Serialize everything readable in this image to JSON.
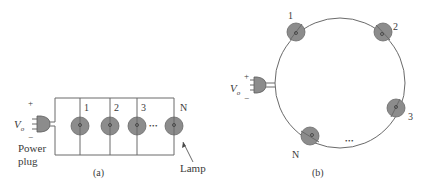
{
  "figure": {
    "panel_a": {
      "caption": "(a)",
      "source_label": {
        "symbol": "V",
        "subscript": "o",
        "plus": "+",
        "minus": "−"
      },
      "plug_label_line1": "Power",
      "plug_label_line2": "plug",
      "lamp_labels": [
        "1",
        "2",
        "3",
        "N"
      ],
      "ellipsis": "•••",
      "lamp_callout": "Lamp",
      "topology": "parallel"
    },
    "panel_b": {
      "caption": "(b)",
      "source_label": {
        "symbol": "V",
        "subscript": "o",
        "plus": "+",
        "minus": "−"
      },
      "lamp_labels": [
        "1",
        "2",
        "3",
        "N"
      ],
      "ellipsis": "•••",
      "topology": "series-ring"
    },
    "colors": {
      "lamp_fill": "#8c8c8c",
      "wire": "#6a6a6a",
      "text": "#3a3a3a"
    }
  }
}
